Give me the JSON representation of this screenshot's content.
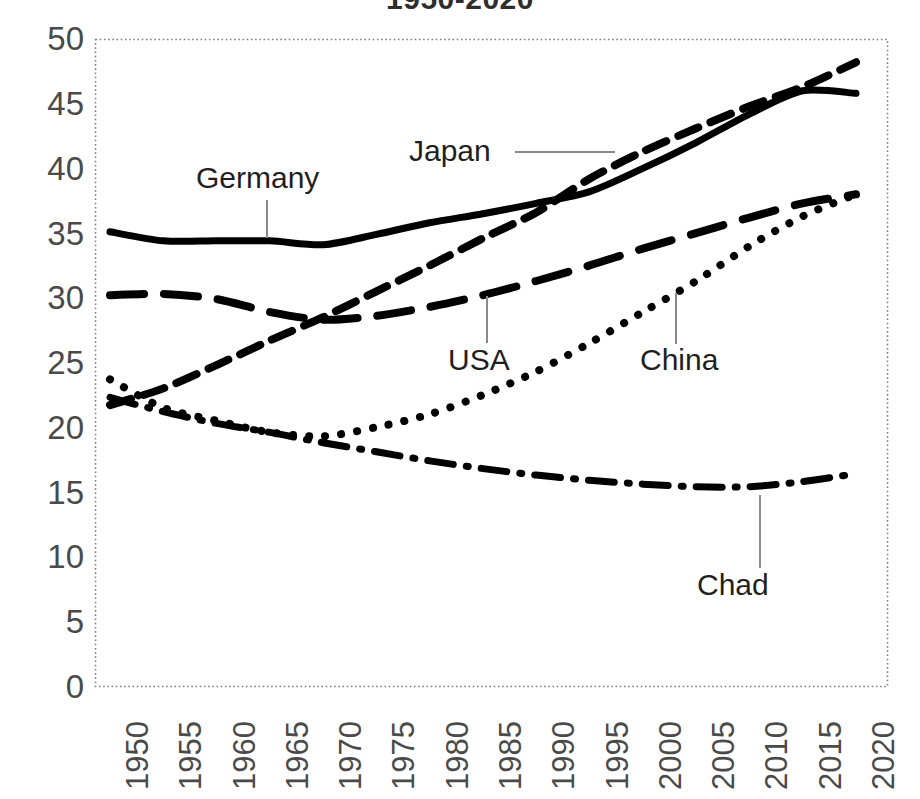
{
  "chart_data": {
    "type": "line",
    "title": "1950-2020",
    "xlabel": "",
    "ylabel": "",
    "xlim": [
      1950,
      2020
    ],
    "ylim": [
      0,
      50
    ],
    "grid": false,
    "legend_position": "inline-annotations",
    "x": [
      1950,
      1955,
      1960,
      1965,
      1970,
      1975,
      1980,
      1985,
      1990,
      1995,
      2000,
      2005,
      2010,
      2015,
      2020
    ],
    "xticklabels": [
      "1950",
      "1955",
      "1960",
      "1965",
      "1970",
      "1975",
      "1980",
      "1985",
      "1990",
      "1995",
      "2000",
      "2005",
      "2010",
      "2015",
      "2020"
    ],
    "yticklabels": [
      "0",
      "5",
      "10",
      "15",
      "20",
      "25",
      "30",
      "35",
      "40",
      "45",
      "50"
    ],
    "yticks": [
      0,
      5,
      10,
      15,
      20,
      25,
      30,
      35,
      40,
      45,
      50
    ],
    "series": [
      {
        "name": "Germany",
        "style": "solid",
        "values": [
          35.1,
          34.4,
          34.4,
          34.4,
          34.1,
          34.9,
          35.8,
          36.5,
          37.3,
          38.2,
          40.0,
          42.0,
          44.2,
          46.0,
          45.8
        ]
      },
      {
        "name": "Japan",
        "style": "dashed-short",
        "values": [
          21.7,
          23.0,
          24.8,
          26.7,
          28.5,
          30.5,
          32.5,
          34.6,
          36.6,
          39.2,
          41.3,
          43.1,
          44.8,
          46.3,
          48.2
        ]
      },
      {
        "name": "USA",
        "style": "dashed-long",
        "values": [
          30.2,
          30.3,
          29.9,
          28.9,
          28.3,
          28.6,
          29.3,
          30.2,
          31.3,
          32.5,
          33.8,
          35.0,
          36.2,
          37.3,
          38.0
        ]
      },
      {
        "name": "China",
        "style": "dotted",
        "values": [
          23.7,
          21.5,
          20.5,
          19.6,
          19.3,
          20.0,
          21.0,
          22.5,
          24.3,
          26.5,
          28.9,
          31.3,
          34.0,
          36.3,
          38.0
        ]
      },
      {
        "name": "Chad",
        "style": "dash-dot",
        "values": [
          22.3,
          21.2,
          20.3,
          19.6,
          18.8,
          18.1,
          17.4,
          16.8,
          16.3,
          15.9,
          15.6,
          15.4,
          15.4,
          15.8,
          16.4
        ]
      }
    ],
    "annotations": [
      {
        "label": "Germany",
        "leader": "vertical-down"
      },
      {
        "label": "Japan",
        "leader": "horizontal-right"
      },
      {
        "label": "USA",
        "leader": "vertical-up"
      },
      {
        "label": "China",
        "leader": "vertical-up"
      },
      {
        "label": "Chad",
        "leader": "vertical-up"
      }
    ]
  },
  "colors": {
    "line": "#000000",
    "axis": "#808080",
    "tick_text": "#4a4a4a",
    "title_text": "#2e2e2e",
    "background": "#ffffff",
    "leader": "#7f7f7f"
  }
}
